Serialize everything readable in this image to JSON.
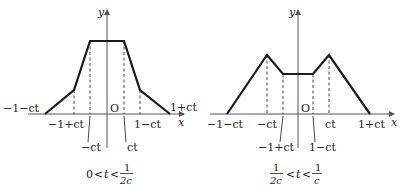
{
  "figures": [
    {
      "id": "left",
      "axis_labels": {
        "y": "y",
        "x": "x",
        "origin": "O"
      },
      "tick_labels": {
        "far_left": "−1−ct",
        "inner_left": "−1+ct",
        "center_left": "−ct",
        "center_right": "ct",
        "inner_right": "1−ct",
        "far_right": "1+ct"
      },
      "caption": {
        "lhs": "0",
        "lt1": "<",
        "var": "t",
        "lt2": "<",
        "num": "1",
        "den": "2c"
      }
    },
    {
      "id": "right",
      "axis_labels": {
        "y": "y",
        "x": "x",
        "origin": "O"
      },
      "tick_labels": {
        "far_left": "−1−ct",
        "peak_left": "−ct",
        "dip_left": "−1+ct",
        "dip_right": "1−ct",
        "peak_right": "ct",
        "far_right": "1+ct"
      },
      "caption": {
        "lnum": "1",
        "lden": "2c",
        "lt1": "<",
        "var": "t",
        "lt2": "<",
        "rnum": "1",
        "rden": "c"
      }
    }
  ],
  "colors": {
    "curve": "#1a1a1a",
    "axis": "#555555",
    "dash": "#333333"
  }
}
